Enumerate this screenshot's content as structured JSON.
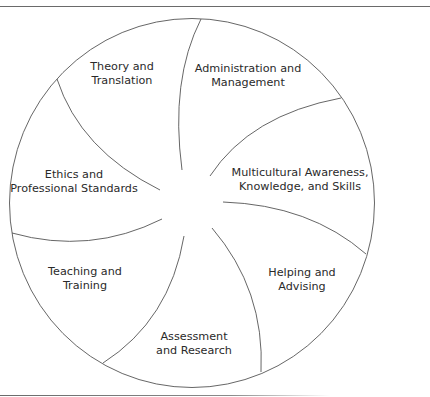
{
  "diagram": {
    "type": "circular-segment-wheel",
    "segments": [
      {
        "id": "theory",
        "lines": [
          "Theory and",
          "Translation"
        ]
      },
      {
        "id": "administration",
        "lines": [
          "Administration and",
          "Management"
        ]
      },
      {
        "id": "multicultural",
        "lines": [
          "Multicultural Awareness,",
          "Knowledge, and Skills"
        ]
      },
      {
        "id": "helping",
        "lines": [
          "Helping and",
          "Advising"
        ]
      },
      {
        "id": "assessment",
        "lines": [
          "Assessment",
          "and Research"
        ]
      },
      {
        "id": "teaching",
        "lines": [
          "Teaching and",
          "Training"
        ]
      },
      {
        "id": "ethics",
        "lines": [
          "Ethics and",
          "Professional Standards"
        ]
      }
    ],
    "colors": {
      "stroke": "#555555",
      "text": "#2a2a2a",
      "background": "#ffffff"
    }
  }
}
